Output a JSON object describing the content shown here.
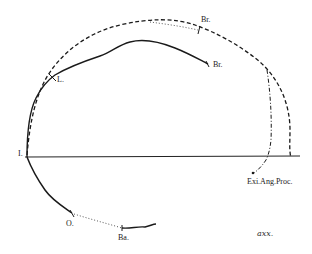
{
  "diagram": {
    "type": "anatomical outline tracing (skull profile comparison)",
    "labels": {
      "origin": "I.",
      "lambda": "L.",
      "bregma_inner": "Br.",
      "bregma_outer": "Br.",
      "opisthion": "O.",
      "basion": "Ba.",
      "external_angular_process": "Exi.Ang.Proc.",
      "signature": "axx."
    },
    "line_styles": {
      "solid": "inner profile",
      "dashed": "outer profile",
      "dotted": "reconstructed segments"
    },
    "colors": {
      "ink": "#1a1a1a",
      "background": "#ffffff"
    }
  }
}
